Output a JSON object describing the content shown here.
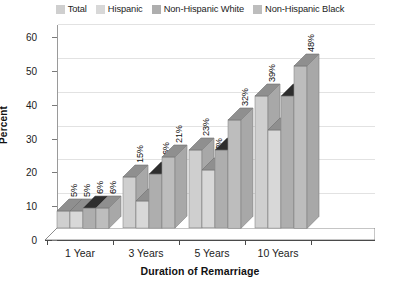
{
  "chart_data": {
    "type": "bar",
    "title": "",
    "subtitle": "",
    "xlabel": "Duration of Remarriage",
    "ylabel": "Percent",
    "categories": [
      "1 Year",
      "3 Years",
      "5 Years",
      "10 Years"
    ],
    "series": [
      {
        "name": "Total",
        "values": [
          5,
          15,
          23,
          39
        ],
        "color": "#cfcfcf"
      },
      {
        "name": "Hispanic",
        "values": [
          5,
          8,
          17,
          29
        ],
        "color": "#d8d8d8"
      },
      {
        "name": "Non-Hispanic White",
        "values": [
          6,
          16,
          23,
          39
        ],
        "color": "#aeaeae"
      },
      {
        "name": "Non-Hispanic Black",
        "values": [
          6,
          21,
          32,
          48
        ],
        "color": "#bdbdbd"
      }
    ],
    "value_labels": [
      [
        "5%",
        "5%",
        "6%",
        "6%"
      ],
      [
        "15%",
        "8%",
        "16%",
        "21%"
      ],
      [
        "23%",
        "17%",
        "23%",
        "32%"
      ],
      [
        "39%",
        "29%",
        "39%",
        "48%"
      ]
    ],
    "ylim": [
      0,
      60
    ],
    "yticks": [
      0,
      10,
      20,
      30,
      40,
      50,
      60
    ],
    "ytick_labels": [
      "0",
      "10",
      "20",
      "30",
      "40",
      "50",
      "60"
    ],
    "grid": true,
    "legend_position": "top",
    "style": "3d-grouped-bar-grayscale"
  },
  "legend": {
    "entries": [
      {
        "label": "Total",
        "swatch": "#cfcfcf"
      },
      {
        "label": "Hispanic",
        "swatch": "#d8d8d8"
      },
      {
        "label": "Non-Hispanic White",
        "swatch": "#aeaeae"
      },
      {
        "label": "Non-Hispanic Black",
        "swatch": "#bdbdbd"
      }
    ]
  },
  "colors": {
    "background": "#ffffff",
    "gridline": "#e2e2e2",
    "axis": "#4a4a4a",
    "text": "#1c1c1c",
    "floor": "#ffffff",
    "bar_top_shade": "#8f8f8f",
    "bar_side_shade": "#9e9e9e"
  }
}
